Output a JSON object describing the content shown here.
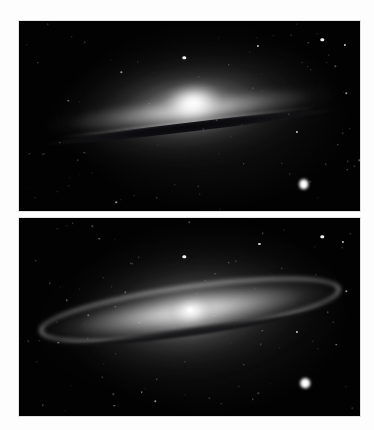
{
  "figure": {
    "page_background": "#fdfdfd",
    "panel_background": "#000000",
    "panel_count": 2,
    "panels": [
      {
        "id": "panel-top",
        "name": "edge-on-view",
        "caption": "",
        "x": 19,
        "y": 21,
        "width": 341,
        "height": 190,
        "galaxy": {
          "core_x_pct": 51,
          "core_y_pct": 43,
          "inclination_label": "near edge-on",
          "disk_rotation_deg": -6.5,
          "dust_lane": "sharp dark band below bulge",
          "bulge_brightness": "very bright"
        },
        "stars": [
          {
            "x_pct": 89.0,
            "y_pct": 10.0,
            "size": "s3"
          },
          {
            "x_pct": 95.5,
            "y_pct": 12.5,
            "size": "s2"
          },
          {
            "x_pct": 70.0,
            "y_pct": 13.0,
            "size": "s2"
          },
          {
            "x_pct": 48.5,
            "y_pct": 19.5,
            "size": "s3"
          },
          {
            "x_pct": 61.5,
            "y_pct": 23.0,
            "size": "s1"
          },
          {
            "x_pct": 83.5,
            "y_pct": 86.0,
            "size": "s5"
          },
          {
            "x_pct": 81.5,
            "y_pct": 58.5,
            "size": "s2"
          },
          {
            "x_pct": 30.0,
            "y_pct": 27.0,
            "size": "s1"
          },
          {
            "x_pct": 14.5,
            "y_pct": 42.0,
            "size": "s1"
          },
          {
            "x_pct": 12.0,
            "y_pct": 64.0,
            "size": "s1"
          },
          {
            "x_pct": 40.5,
            "y_pct": 93.0,
            "size": "s1"
          },
          {
            "x_pct": 28.5,
            "y_pct": 95.5,
            "size": "s1"
          },
          {
            "x_pct": 93.5,
            "y_pct": 65.0,
            "size": "s1"
          },
          {
            "x_pct": 5.5,
            "y_pct": 22.0,
            "size": "s1"
          },
          {
            "x_pct": 66.0,
            "y_pct": 75.0,
            "size": "s1"
          },
          {
            "x_pct": 96.0,
            "y_pct": 38.0,
            "size": "s1"
          }
        ]
      },
      {
        "id": "panel-bottom",
        "name": "tilted-disk-view",
        "caption": "",
        "x": 19,
        "y": 218,
        "width": 341,
        "height": 198,
        "galaxy": {
          "core_x_pct": 50.5,
          "core_y_pct": 47,
          "inclination_label": "slightly tilted disk",
          "disk_rotation_deg": -8,
          "dust_lane": "curved dark ring below bright disk ring",
          "bulge_brightness": "moderate with stellar nucleus"
        },
        "stars": [
          {
            "x_pct": 89.0,
            "y_pct": 9.5,
            "size": "s3"
          },
          {
            "x_pct": 95.0,
            "y_pct": 12.0,
            "size": "s2"
          },
          {
            "x_pct": 70.5,
            "y_pct": 13.0,
            "size": "s2"
          },
          {
            "x_pct": 48.5,
            "y_pct": 19.5,
            "size": "s3"
          },
          {
            "x_pct": 61.5,
            "y_pct": 22.5,
            "size": "s1"
          },
          {
            "x_pct": 84.0,
            "y_pct": 83.5,
            "size": "s5"
          },
          {
            "x_pct": 81.5,
            "y_pct": 57.5,
            "size": "s2"
          },
          {
            "x_pct": 23.5,
            "y_pct": 10.5,
            "size": "s1"
          },
          {
            "x_pct": 14.0,
            "y_pct": 41.5,
            "size": "s1"
          },
          {
            "x_pct": 11.5,
            "y_pct": 63.0,
            "size": "s1"
          },
          {
            "x_pct": 40.0,
            "y_pct": 92.5,
            "size": "s1"
          },
          {
            "x_pct": 28.0,
            "y_pct": 95.0,
            "size": "s1"
          },
          {
            "x_pct": 93.0,
            "y_pct": 64.0,
            "size": "s1"
          },
          {
            "x_pct": 5.0,
            "y_pct": 21.5,
            "size": "s1"
          },
          {
            "x_pct": 66.0,
            "y_pct": 74.0,
            "size": "s1"
          },
          {
            "x_pct": 96.0,
            "y_pct": 37.0,
            "size": "s1"
          },
          {
            "x_pct": 36.0,
            "y_pct": 88.0,
            "size": "s1"
          }
        ]
      }
    ]
  }
}
